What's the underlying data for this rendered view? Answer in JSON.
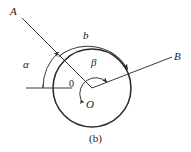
{
  "figure": {
    "caption": "(b)",
    "stroke_color": "#262626",
    "background_color": "#ffffff",
    "labels": {
      "ray_a_label": "A",
      "ray_b_label": "B",
      "arc_outer_label": "b",
      "angle_alpha_label": "α",
      "angle_beta_label": "β",
      "center_label": "O",
      "origin_label": "0"
    },
    "geometry": {
      "center_x": 92,
      "center_y": 88,
      "circle_radius": 39,
      "outer_arc_radius": 46,
      "alpha_arc_radius": 49,
      "beta_arc_radius": 16,
      "ray_A_angle_deg": 133,
      "ray_B_angle_deg": 22,
      "baseline_angle_deg": 180
    }
  }
}
